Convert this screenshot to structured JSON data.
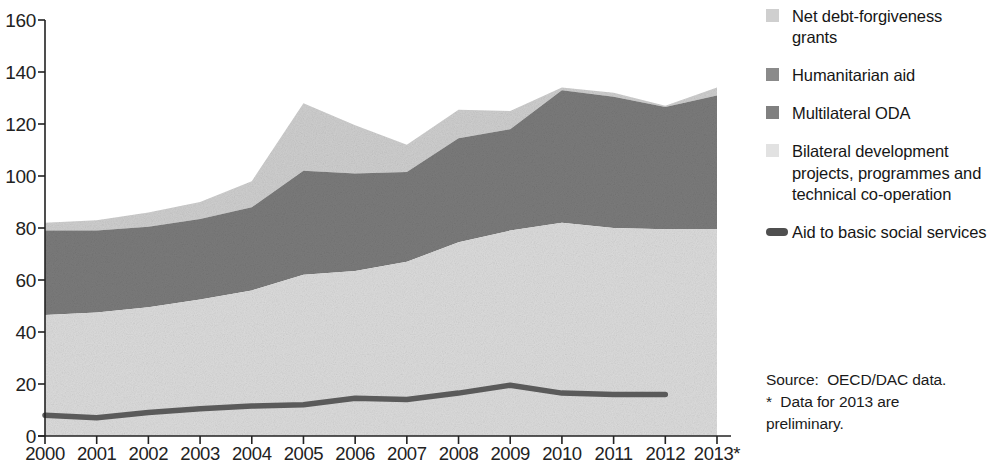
{
  "chart_data": {
    "type": "area",
    "stacked": true,
    "title": "",
    "subtitle": "",
    "xlabel": "",
    "ylabel": "",
    "xlim": [
      2000,
      2013
    ],
    "ylim": [
      0,
      160
    ],
    "yticks": [
      0,
      20,
      40,
      60,
      80,
      100,
      120,
      140,
      160
    ],
    "grid": false,
    "legend_position": "right",
    "categories": [
      "2000",
      "2001",
      "2002",
      "2003",
      "2004",
      "2005",
      "2006",
      "2007",
      "2008",
      "2009",
      "2010",
      "2011",
      "2012",
      "2013*"
    ],
    "x": [
      2000,
      2001,
      2002,
      2003,
      2004,
      2005,
      2006,
      2007,
      2008,
      2009,
      2010,
      2011,
      2012,
      2013
    ],
    "series": [
      {
        "name": "Bilateral development projects, programmes and technical co-operation",
        "color": "#dcdcdc",
        "stack_order": 1,
        "values": [
          46.5,
          47.5,
          49.5,
          52.5,
          56.0,
          62.0,
          63.5,
          67.0,
          74.5,
          79.0,
          82.0,
          80.0,
          79.5,
          79.5
        ]
      },
      {
        "name": "Multilateral ODA",
        "color": "#7b7b7b",
        "stack_order": 2,
        "values": [
          32.5,
          31.5,
          31.0,
          31.0,
          32.0,
          40.0,
          37.5,
          34.5,
          40.0,
          39.0,
          51.0,
          50.5,
          47.0,
          51.5
        ]
      },
      {
        "name": "Humanitarian aid",
        "color": "#7b7b7b",
        "stack_order": 3,
        "values": [
          0,
          0,
          0,
          0,
          0,
          0,
          0,
          0,
          0,
          0,
          0,
          0,
          0,
          0
        ]
      },
      {
        "name": "Net debt-forgiveness grants",
        "color": "#cfcfcf",
        "stack_order": 4,
        "values": [
          3.0,
          4.0,
          5.5,
          6.5,
          10.0,
          26.0,
          18.5,
          10.5,
          11.0,
          7.0,
          1.0,
          1.5,
          0.5,
          3.0
        ]
      }
    ],
    "stack_tops": {
      "bilateral": [
        46.5,
        47.5,
        49.5,
        52.5,
        56.0,
        62.0,
        63.5,
        67.0,
        74.5,
        79.0,
        82.0,
        80.0,
        79.5,
        79.5
      ],
      "multilateral_oda": [
        79.0,
        79.0,
        80.5,
        83.5,
        88.0,
        102.0,
        101.0,
        101.5,
        114.5,
        118.0,
        133.0,
        130.5,
        126.5,
        131.0
      ],
      "humanitarian_aid": [
        79.0,
        79.0,
        80.5,
        83.5,
        88.0,
        102.0,
        101.0,
        101.5,
        114.5,
        118.0,
        133.0,
        130.5,
        126.5,
        131.0
      ],
      "total": [
        82.0,
        83.0,
        86.0,
        90.0,
        98.0,
        128.0,
        119.5,
        112.0,
        125.5,
        125.0,
        134.0,
        132.0,
        127.0,
        134.0
      ]
    },
    "line_series": {
      "name": "Aid to basic social services",
      "color": "#5a5a5a",
      "x": [
        2000,
        2001,
        2002,
        2003,
        2004,
        2005,
        2006,
        2007,
        2008,
        2009,
        2010,
        2011,
        2012
      ],
      "values": [
        8.0,
        7.0,
        9.0,
        10.5,
        11.5,
        12.0,
        14.5,
        14.0,
        16.5,
        19.5,
        16.5,
        16.0,
        16.0
      ]
    }
  },
  "axes": {
    "y_tick_labels": [
      "160",
      "140",
      "120",
      "100",
      "80",
      "60",
      "40",
      "20",
      "0"
    ],
    "x_tick_labels": [
      "2000",
      "2001",
      "2002",
      "2003",
      "2004",
      "2005",
      "2006",
      "2007",
      "2008",
      "2009",
      "2010",
      "2011",
      "2012",
      "2013*"
    ]
  },
  "legend": {
    "items": [
      {
        "label": "Net debt-forgiveness grants",
        "swatch": "legend-swatch-net-debt-forgiveness",
        "color": "#cfcfcf",
        "kind": "square"
      },
      {
        "label": "Humanitarian aid",
        "swatch": "legend-swatch-humanitarian-aid",
        "color": "#8a8a8a",
        "kind": "square"
      },
      {
        "label": "Multilateral ODA",
        "swatch": "legend-swatch-multilateral-oda",
        "color": "#808080",
        "kind": "square"
      },
      {
        "label": "Bilateral development projects, programmes and technical co-operation",
        "swatch": "legend-swatch-bilateral-development",
        "color": "#e2e2e2",
        "kind": "square"
      },
      {
        "label": "Aid to basic social services",
        "swatch": "legend-swatch-aid-basic-social-services",
        "color": "#4f4f4f",
        "kind": "line"
      }
    ]
  },
  "source": {
    "line1": "Source:  OECD/DAC data.",
    "line2": "*  Data for 2013 are",
    "line3": "preliminary."
  },
  "colors": {
    "net_debt_forgiveness": "#cfcfcf",
    "humanitarian_aid": "#7b7b7b",
    "multilateral_oda": "#7b7b7b",
    "bilateral_development": "#dcdcdc",
    "basic_social_services_line": "#5a5a5a",
    "axis": "#222222",
    "background": "#ffffff"
  }
}
